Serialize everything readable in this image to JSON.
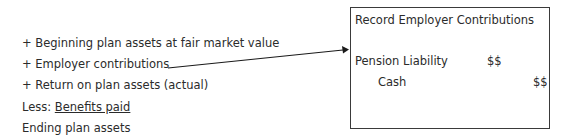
{
  "left_list": {
    "items": [
      {
        "prefix": "+ ",
        "text": "Beginning plan assets at fair market value"
      },
      {
        "prefix": "+ ",
        "text": "Employer contributions"
      },
      {
        "prefix": "+ ",
        "text": "Return on plan assets (actual)"
      },
      {
        "prefix": "Less: ",
        "text": "Benefits paid"
      },
      {
        "prefix": "",
        "text": "Ending plan assets"
      }
    ]
  },
  "journal_box": {
    "title": "Record Employer Contributions",
    "debit": {
      "account": "Pension Liability",
      "amount": "$$"
    },
    "credit": {
      "account": "Cash",
      "amount": "$$"
    }
  },
  "arrow": {
    "from": "Employer contributions",
    "to": "Record Employer Contributions"
  }
}
